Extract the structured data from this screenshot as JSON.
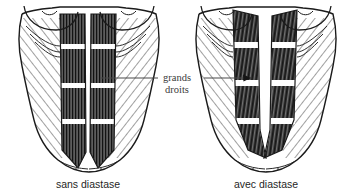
{
  "figure": {
    "type": "anatomical-illustration",
    "language": "fr",
    "background_color": "#ffffff",
    "ink_color": "#1f1f1f",
    "label_color": "#3b3b3b",
    "muscle_dark_color": "#2a2a2a",
    "muscle_mid_color": "#6f6f6f",
    "tendon_color": "#ffffff"
  },
  "center_label": {
    "line1": "grands",
    "line2": "droits",
    "meaning": "rectus abdominis",
    "leader_left": true,
    "leader_right": true,
    "leader_right_arrowhead": true
  },
  "panels": [
    {
      "id": "left",
      "caption": "sans diastase",
      "caption_meaning": "without diastasis",
      "rectus_gap_px": 6,
      "tendinous_bands": 3,
      "linea_alba": "narrow",
      "breasts_visible": true,
      "oblique_hatching": true,
      "serratus_scallops": 3
    },
    {
      "id": "right",
      "caption": "avec diastase",
      "caption_meaning": "with diastasis",
      "rectus_gap_px": 20,
      "tendinous_bands": 3,
      "linea_alba": "wide",
      "breasts_visible": true,
      "oblique_hatching": true,
      "serratus_scallops": 3
    }
  ]
}
